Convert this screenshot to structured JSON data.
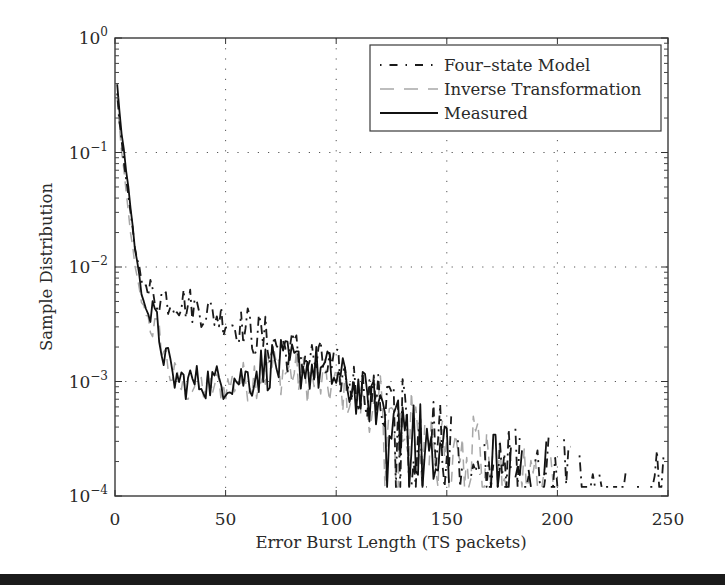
{
  "chart_data": {
    "type": "line",
    "title": "",
    "xlabel": "Error Burst Length (TS packets)",
    "ylabel": "Sample Distribution",
    "xlim": [
      0,
      250
    ],
    "ylim": [
      0.0001,
      1
    ],
    "yscale": "log",
    "x_ticks": [
      0,
      50,
      100,
      150,
      200,
      250
    ],
    "x_tick_labels": [
      "0",
      "50",
      "100",
      "150",
      "200",
      "250"
    ],
    "y_ticks": [
      1,
      0.1,
      0.01,
      0.001,
      0.0001
    ],
    "y_tick_labels": [
      {
        "base": "10",
        "exp": "0"
      },
      {
        "base": "10",
        "exp": "-1"
      },
      {
        "base": "10",
        "exp": "-2"
      },
      {
        "base": "10",
        "exp": "-3"
      },
      {
        "base": "10",
        "exp": "-4"
      }
    ],
    "grid": true,
    "legend_position": "upper right",
    "series": [
      {
        "name": "Four-state Model",
        "style": "dash-dot",
        "color": "#1a1a1a",
        "anchors_x": [
          1,
          3,
          6,
          9,
          12,
          15,
          20,
          30,
          40,
          50,
          60,
          70,
          80,
          90,
          100,
          110,
          120,
          130,
          140,
          150,
          160,
          170,
          180,
          190,
          200,
          210,
          220,
          230,
          240,
          248
        ],
        "anchors_y": [
          0.33,
          0.12,
          0.04,
          0.015,
          0.008,
          0.006,
          0.0055,
          0.005,
          0.0042,
          0.0035,
          0.0028,
          0.0022,
          0.0018,
          0.0015,
          0.0012,
          0.0009,
          0.0007,
          0.0005,
          0.0004,
          0.0003,
          0.00025,
          0.0002,
          0.00018,
          0.00016,
          0.00015,
          0.00014,
          0.00013,
          0.00013,
          0.00012,
          0.00012
        ]
      },
      {
        "name": "Inverse Transformation",
        "style": "dashed",
        "color": "#a8a8a8",
        "anchors_x": [
          1,
          3,
          6,
          9,
          12,
          15,
          20,
          25,
          30,
          40,
          50,
          60,
          70,
          80,
          90,
          100,
          110,
          120,
          130,
          140,
          150,
          160,
          170,
          180,
          190,
          200
        ],
        "anchors_y": [
          0.3,
          0.1,
          0.03,
          0.01,
          0.005,
          0.0035,
          0.0025,
          0.0012,
          0.0009,
          0.0009,
          0.0009,
          0.0011,
          0.0013,
          0.0012,
          0.001,
          0.0009,
          0.0007,
          0.0005,
          0.0004,
          0.00035,
          0.0003,
          0.00025,
          0.0002,
          0.00017,
          0.00015,
          0.00013
        ]
      },
      {
        "name": "Measured",
        "style": "solid",
        "color": "#111111",
        "anchors_x": [
          1,
          3,
          6,
          9,
          12,
          15,
          18,
          22,
          26,
          30,
          40,
          50,
          60,
          70,
          80,
          90,
          100,
          110,
          120,
          130,
          140,
          150,
          160,
          170,
          180,
          190,
          200
        ],
        "anchors_y": [
          0.37,
          0.15,
          0.05,
          0.015,
          0.006,
          0.004,
          0.0035,
          0.0018,
          0.0011,
          0.001,
          0.001,
          0.001,
          0.0011,
          0.0014,
          0.0014,
          0.0013,
          0.0011,
          0.0008,
          0.0006,
          0.00045,
          0.0003,
          0.00025,
          0.0002,
          0.00017,
          0.00016,
          0.00015,
          0.00014
        ]
      }
    ]
  },
  "legend": {
    "items": [
      {
        "label": "Four–state Model"
      },
      {
        "label": "Inverse Transformation"
      },
      {
        "label": "Measured"
      }
    ]
  }
}
